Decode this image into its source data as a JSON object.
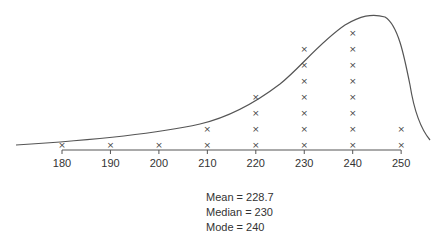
{
  "chart_data": {
    "type": "dot_plot",
    "title": "",
    "xlabel": "",
    "ylabel": "",
    "categories": [
      180,
      190,
      200,
      210,
      220,
      230,
      240,
      250
    ],
    "values": [
      1,
      1,
      1,
      2,
      4,
      7,
      8,
      2
    ],
    "tick_labels": [
      "180",
      "190",
      "200",
      "210",
      "220",
      "230",
      "240",
      "250"
    ],
    "marker": "×",
    "overlay": "smooth left-skewed distribution curve peaking near 240",
    "xlim": [
      170,
      255
    ],
    "grid": false,
    "legend": null,
    "annotations": [
      "Mean = 228.7",
      "Median = 230",
      "Mode = 240"
    ]
  },
  "stats": {
    "mean": "Mean = 228.7",
    "median": "Median = 230",
    "mode": "Mode = 240"
  },
  "colors": {
    "line": "#555555",
    "marker": "#444444",
    "text": "#333333"
  }
}
